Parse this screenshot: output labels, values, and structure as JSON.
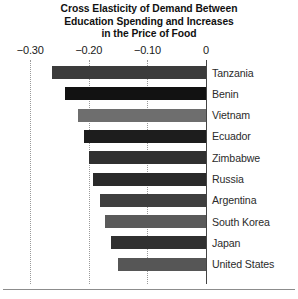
{
  "chart_data": {
    "type": "bar",
    "orientation": "horizontal",
    "title": "Cross Elasticity of Demand Between Education Spending and Increases in the Price of Food",
    "title_lines": [
      "Cross Elasticity of Demand Between",
      "Education Spending and Increases",
      "in the Price of Food"
    ],
    "xlabel": "",
    "ylabel": "",
    "xlim": [
      -0.32,
      0.0
    ],
    "xticks": [
      -0.3,
      -0.2,
      -0.1,
      0
    ],
    "xtick_labels": [
      "−0.30",
      "−0.20",
      "−0.10",
      "0"
    ],
    "axis_position": "top",
    "grid": true,
    "grid_style": "dotted",
    "legend": "none",
    "categories": [
      "Tanzania",
      "Benin",
      "Vietnam",
      "Ecuador",
      "Zimbabwe",
      "Russia",
      "Argentina",
      "South Korea",
      "Japan",
      "United States"
    ],
    "values": [
      -0.262,
      -0.24,
      -0.219,
      -0.209,
      -0.2,
      -0.192,
      -0.181,
      -0.172,
      -0.162,
      -0.15
    ],
    "bar_colors": [
      "#3b3b3b",
      "#121212",
      "#6e6e6e",
      "#1d1d1d",
      "#303030",
      "#2a2a2a",
      "#3f3f3f",
      "#5a5a5a",
      "#303030",
      "#565656"
    ]
  },
  "colors": {
    "background": "#ffffff",
    "title_text": "#111111",
    "axis_line": "#444444",
    "gridline": "#9a9a9a",
    "label_text": "#2b2b2b",
    "bottom_rule": "#8c8c8c"
  }
}
